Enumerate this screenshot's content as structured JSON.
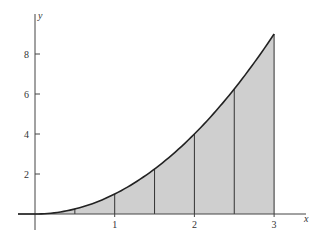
{
  "chart_data": {
    "type": "area",
    "title": "",
    "function": "y = x^2",
    "xlabel": "x",
    "ylabel": "y",
    "xlim": [
      -0.2,
      3.4
    ],
    "ylim": [
      -0.4,
      10.0
    ],
    "x_ticks": [
      1,
      2,
      3
    ],
    "x_tick_labels": [
      "1",
      "2",
      "3"
    ],
    "y_ticks": [
      2,
      4,
      6,
      8
    ],
    "y_tick_labels": [
      "2",
      "4",
      "6",
      "8"
    ],
    "grid": false,
    "legend": null,
    "shaded_region": {
      "from": 0,
      "to": 3,
      "color": "#cfcfcf"
    },
    "partition_lines_x": [
      0.5,
      1,
      1.5,
      2,
      2.5,
      3
    ],
    "x": [
      0,
      0.5,
      1,
      1.5,
      2,
      2.5,
      3
    ],
    "values": [
      0,
      0.25,
      1,
      2.25,
      4,
      6.25,
      9
    ]
  },
  "colors": {
    "fill": "#cfcfcf",
    "curve": "#222222",
    "axis": "#444444"
  }
}
